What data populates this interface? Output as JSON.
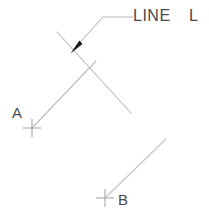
{
  "drawing": {
    "width": 209,
    "height": 221,
    "background_color": "#ffffff",
    "line_color": "#b9b9b9",
    "text_color": "#4a4a4a",
    "arrow_color": "#1a1a1a",
    "annotation": {
      "primary_text": "LINE",
      "secondary_text": "L"
    },
    "points": [
      {
        "id": "point-a",
        "label": "A",
        "marker": "cross-marker",
        "x": 32,
        "y": 128,
        "label_x": 12,
        "label_y": 118
      },
      {
        "id": "point-b",
        "label": "B",
        "marker": "cross-marker",
        "x": 105,
        "y": 198,
        "label_x": 118,
        "label_y": 205
      }
    ],
    "segments": [
      {
        "id": "segment-upper-diagonal",
        "x1": 57,
        "y1": 32,
        "x2": 131,
        "y2": 113
      },
      {
        "id": "segment-from-a",
        "x1": 32,
        "y1": 128,
        "x2": 96,
        "y2": 61
      },
      {
        "id": "segment-from-b",
        "x1": 105,
        "y1": 198,
        "x2": 166,
        "y2": 139
      }
    ],
    "leader": {
      "id": "leader-line",
      "tip_x": 71,
      "tip_y": 52,
      "bend_x": 103,
      "bend_y": 17,
      "end_x": 133,
      "end_y": 17
    }
  }
}
